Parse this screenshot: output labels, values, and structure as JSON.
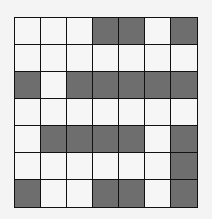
{
  "board": {
    "rows": 7,
    "cols": 7,
    "colors": {
      "filled": "#6e6e6e",
      "empty": "#f6f6f6",
      "line": "#111111"
    },
    "cells": [
      [
        0,
        0,
        0,
        1,
        1,
        0,
        1
      ],
      [
        0,
        0,
        0,
        0,
        0,
        0,
        0
      ],
      [
        1,
        0,
        1,
        1,
        1,
        1,
        1
      ],
      [
        0,
        0,
        0,
        0,
        0,
        0,
        0
      ],
      [
        0,
        1,
        1,
        1,
        1,
        0,
        1
      ],
      [
        0,
        0,
        0,
        0,
        0,
        0,
        1
      ],
      [
        1,
        0,
        0,
        1,
        1,
        0,
        1
      ]
    ]
  }
}
